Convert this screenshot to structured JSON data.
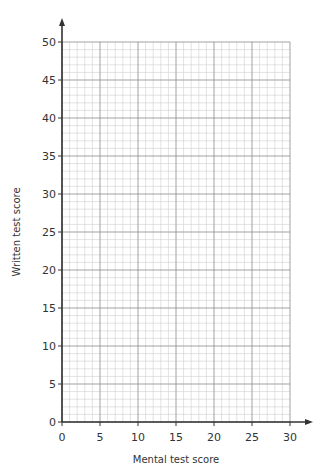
{
  "chart_data": {
    "type": "scatter",
    "title": "",
    "xlabel": "Mental test score",
    "ylabel": "Written test score",
    "xlim": [
      0,
      30
    ],
    "ylim": [
      0,
      50
    ],
    "x_ticks": [
      0,
      5,
      10,
      15,
      20,
      25,
      30
    ],
    "y_ticks": [
      0,
      5,
      10,
      15,
      20,
      25,
      30,
      35,
      40,
      45,
      50
    ],
    "x_tick_labels": [
      "0",
      "5",
      "10",
      "15",
      "20",
      "25",
      "30"
    ],
    "y_tick_labels": [
      "0",
      "5",
      "10",
      "15",
      "20",
      "25",
      "30",
      "35",
      "40",
      "45",
      "50"
    ],
    "x_minor_step": 1,
    "y_minor_step": 1,
    "grid": true,
    "points": [],
    "colors": {
      "axis": "#333333",
      "major_grid": "#8a8a8a",
      "minor_grid": "#cfcfcf"
    }
  }
}
